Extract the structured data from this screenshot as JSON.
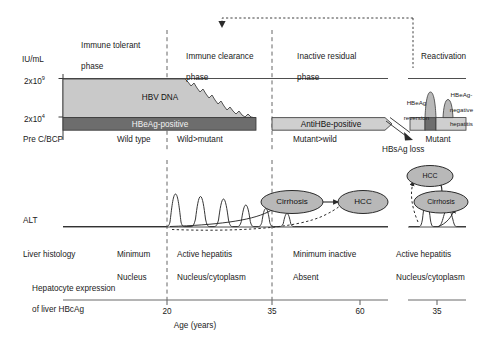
{
  "figure": {
    "axis": {
      "y_unit": "IU/mL",
      "y_ticks": [
        {
          "mantissa": "2x10",
          "exponent": "9"
        },
        {
          "mantissa": "2x10",
          "exponent": "4"
        }
      ],
      "x_label": "Age (years)",
      "x_ticks": [
        "20",
        "35",
        "60"
      ],
      "x_tick_inset": "35"
    },
    "phases": [
      {
        "id": "immune-tolerant",
        "line1": "Immune tolerant",
        "line2": "phase"
      },
      {
        "id": "immune-clearance",
        "line1": "Immune clearance",
        "line2": "phase"
      },
      {
        "id": "inactive-residual",
        "line1": "Inactive residual",
        "line2": "phase"
      },
      {
        "id": "reactivation",
        "line1": "Reactivation",
        "line2": ""
      }
    ],
    "serology": {
      "hbv_dna_label": "HBV DNA",
      "hbeag_positive_label": "HBeAg-positive",
      "antihbe_positive_label": "AntiHBe-positive",
      "hbsag_loss_label": "HBsAg loss"
    },
    "variant_row": [
      {
        "id": "variant-precbcp",
        "text": "Pre C/BCP"
      },
      {
        "id": "variant-wild-type",
        "text": "Wild type"
      },
      {
        "id": "variant-wild-mutant",
        "text": "Wild>mutant"
      },
      {
        "id": "variant-mutant-wild",
        "text": "Mutant>wild"
      },
      {
        "id": "variant-mutant",
        "text": "Mutant"
      }
    ],
    "alt": {
      "label": "ALT"
    },
    "rows": [
      {
        "id": "liver-histology",
        "header": "Liver histology",
        "cells": [
          "Minimum",
          "Active hepatitis",
          "Minimum inactive",
          "Active hepatitis"
        ]
      },
      {
        "id": "hepatocyte-expression",
        "header_line1": "Hepatocyte expression",
        "header_line2": "of liver HBcAg",
        "cells": [
          "Nucleus",
          "Nucleus/cytoplasm",
          "Absent",
          "Nucleus/cytoplasm"
        ]
      }
    ],
    "outcomes": [
      {
        "id": "cirrhosis-main",
        "label": "Cirrhosis"
      },
      {
        "id": "hcc-main",
        "label": "HCC"
      },
      {
        "id": "hcc-reactivation",
        "label": "HCC"
      },
      {
        "id": "cirrhosis-reactivation",
        "label": "Cirrhosis"
      }
    ],
    "reactivation_annotations": [
      {
        "id": "hbeag-reversion",
        "line1": "HBeAg",
        "line2": "reversion"
      },
      {
        "id": "hbeag-negative-hepatitis",
        "line1": "HBeAg-",
        "line2": "negative",
        "line3": "hepatitis"
      }
    ],
    "colors": {
      "hbv_dna_fill": "#c9c9c9",
      "hbeag_fill": "#6d6d6d",
      "antihbe_fill": "#cfcfcf",
      "node_fill": "#b8b8b8",
      "line": "#4a4a4a",
      "text": "#1a1a1a",
      "background": "#ffffff"
    }
  }
}
